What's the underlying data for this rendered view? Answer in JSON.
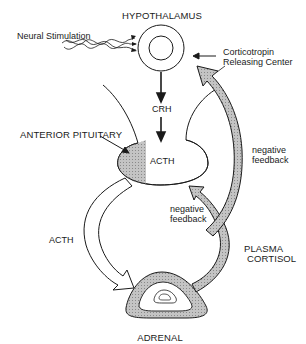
{
  "title": "HYPOTHALAMUS",
  "labels": {
    "neural_stimulation": "Neural Stimulation",
    "crc_line1": "Corticotropin",
    "crc_line2": "Releasing Center",
    "crh": "CRH",
    "anterior_pituitary": "ANTERIOR PITUITARY",
    "acth_pituitary": "ACTH",
    "acth_arrow": "ACTH",
    "neg_feedback_right_line1": "negative",
    "neg_feedback_right_line2": "feedback",
    "neg_feedback_inner_line1": "negative",
    "neg_feedback_inner_line2": "feedback",
    "plasma_cortisol_line1": "PLASMA",
    "plasma_cortisol_line2": "CORTISOL",
    "adrenal": "ADRENAL"
  },
  "colors": {
    "stroke": "#1a1a1a",
    "shade": "#b8b8b8",
    "background": "#ffffff"
  }
}
